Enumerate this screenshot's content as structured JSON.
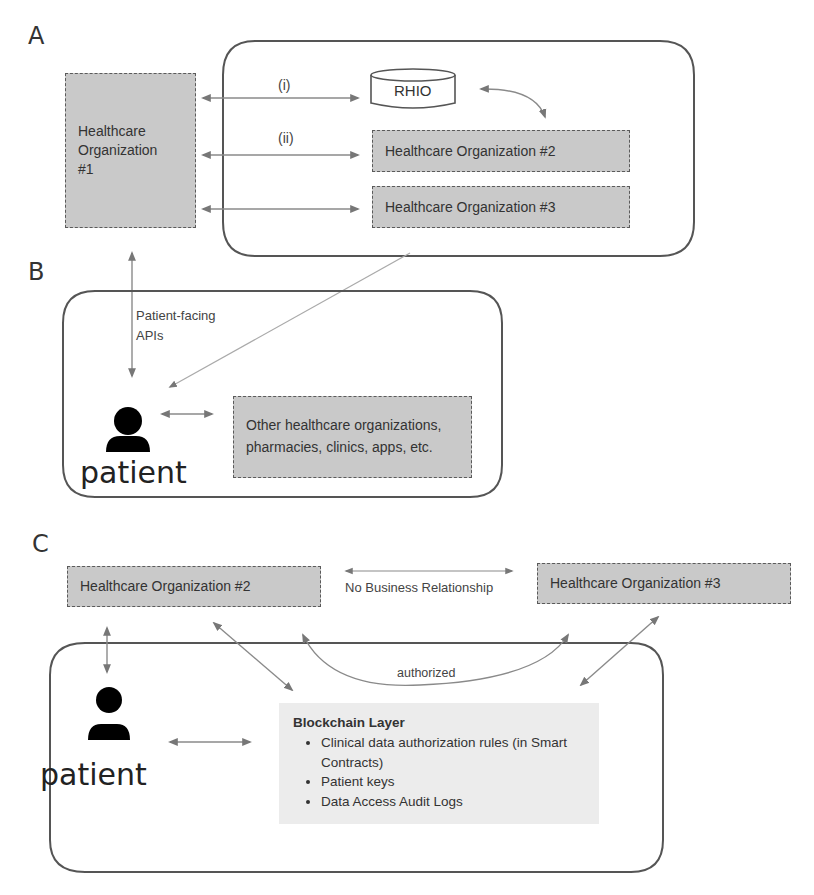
{
  "sections": {
    "a": {
      "letter": "A",
      "org1": {
        "line1": "Healthcare",
        "line2": "Organization",
        "line3": "#1"
      },
      "rhio": "RHIO",
      "org2": "Healthcare Organization #2",
      "org3": "Healthcare Organization #3",
      "arrow_labels": [
        "(i)",
        "(ii)"
      ]
    },
    "b": {
      "letter": "B",
      "api_label_line1": "Patient-facing",
      "api_label_line2": "APIs",
      "patient_label": "patient",
      "others_line1": "Other healthcare organizations,",
      "others_line2": "pharmacies, clinics, apps, etc."
    },
    "c": {
      "letter": "C",
      "org2": "Healthcare Organization #2",
      "org3": "Healthcare Organization #3",
      "relationship_label": "No Business Relationship",
      "authorized_label": "authorized",
      "patient_label": "patient",
      "blockchain": {
        "title": "Blockchain Layer",
        "items": [
          "Clinical data authorization rules (in Smart Contracts)",
          "Patient keys",
          "Data Access Audit Logs"
        ]
      }
    }
  },
  "colors": {
    "box_fill": "#c9c9c9",
    "box_border": "#5a5a5a",
    "arrow": "#8a8a8a",
    "container_border": "#555555",
    "blockchain_fill": "#ececec"
  }
}
